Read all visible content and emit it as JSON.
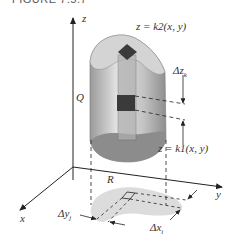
{
  "figure": {
    "title": "FIGURE 7.5.7",
    "labels": {
      "z_axis": "z",
      "x_axis": "x",
      "y_axis": "y",
      "solid": "Q",
      "region": "R",
      "top_surface": "z = k2(x, y)",
      "bottom_surface": "z = k1(x, y)",
      "delta_z": "Δz",
      "delta_z_sub": "k",
      "delta_x": "Δx",
      "delta_x_sub": "i",
      "delta_y": "Δy",
      "delta_y_sub": "j"
    },
    "colors": {
      "solid_fill": "#c8c8c8",
      "solid_dark": "#8c8c8c",
      "region_fill": "#dcdcdc",
      "box_fill": "#3a3a3a",
      "axis": "#222222"
    }
  }
}
